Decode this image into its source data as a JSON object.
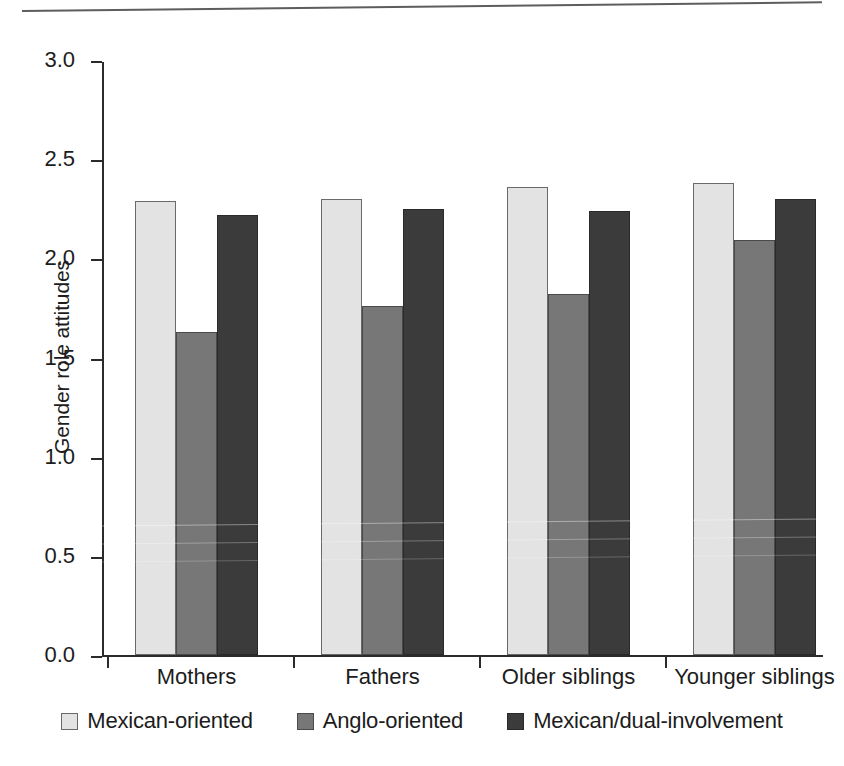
{
  "figure": {
    "background": "#ffffff",
    "top_rule": true
  },
  "chart_data": {
    "type": "bar",
    "title": "",
    "xlabel": "",
    "ylabel": "Gender role attitudes",
    "categories": [
      "Mothers",
      "Fathers",
      "Older siblings",
      "Younger siblings"
    ],
    "series": [
      {
        "name": "Mexican-oriented",
        "color": "#e3e3e3",
        "values": [
          2.29,
          2.3,
          2.36,
          2.38
        ]
      },
      {
        "name": "Anglo-oriented",
        "color": "#777777",
        "values": [
          1.63,
          1.76,
          1.82,
          2.09
        ]
      },
      {
        "name": "Mexican/dual-involvement",
        "color": "#3b3b3b",
        "values": [
          2.22,
          2.25,
          2.24,
          2.3
        ]
      }
    ],
    "ylim": [
      0.0,
      3.0
    ],
    "ytick_labels": [
      "3.0",
      "2.5",
      "2.0",
      "1.5",
      "1.0",
      "0.5",
      "0.0"
    ],
    "ytick_values": [
      3.0,
      2.5,
      2.0,
      1.5,
      1.0,
      0.5,
      0.0
    ],
    "grid": false,
    "legend_position": "bottom"
  },
  "legend": {
    "items": [
      {
        "label": "Mexican-oriented",
        "swatch": "#e3e3e3"
      },
      {
        "label": "Anglo-oriented",
        "swatch": "#777777"
      },
      {
        "label": "Mexican/dual-involvement",
        "swatch": "#3b3b3b"
      }
    ]
  }
}
